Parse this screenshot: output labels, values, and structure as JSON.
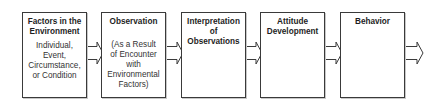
{
  "diagram": {
    "type": "flowchart",
    "direction": "left-to-right",
    "steps": [
      {
        "title": "Factors in the Environment",
        "title_lines": [
          "Factors in the",
          "Environment"
        ],
        "description_lines": [
          "Individual,",
          "Event,",
          "Circumstance,",
          "or Condition"
        ]
      },
      {
        "title": "Observation",
        "title_lines": [
          "Observation"
        ],
        "description_lines": [
          "(As a Result",
          "of Encounter",
          "with",
          "Environmental",
          "Factors)"
        ]
      },
      {
        "title": "Interpretation of Observations",
        "title_lines": [
          "Interpretation",
          "of",
          "Observations"
        ],
        "description_lines": []
      },
      {
        "title": "Attitude Development",
        "title_lines": [
          "Attitude",
          "Development"
        ],
        "description_lines": []
      },
      {
        "title": "Behavior",
        "title_lines": [
          "Behavior"
        ],
        "description_lines": []
      }
    ],
    "connectors": [
      "arrow-1-2",
      "arrow-2-3",
      "arrow-3-4",
      "arrow-4-5",
      "arrow-5-out"
    ],
    "colors": {
      "border": "#3a3a3a",
      "text": "#1e1e1e",
      "background": "#ffffff"
    }
  }
}
